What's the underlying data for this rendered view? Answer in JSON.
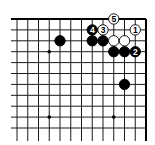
{
  "diagram": {
    "type": "go-board-fragment",
    "edges": [
      "top",
      "right"
    ],
    "grid": {
      "columns": 13,
      "rows": 11,
      "origin_x": 17,
      "origin_y": 19,
      "spacing_x": 10.75,
      "spacing_y": 10.9,
      "line_color": "#1a1a1a",
      "edge_color": "#000000"
    },
    "star_points": [
      {
        "col": 3,
        "row": 3
      },
      {
        "col": 3,
        "row": 9
      },
      {
        "col": 9,
        "row": 9
      }
    ],
    "stones": [
      {
        "col": 4,
        "row": 2,
        "color": "black",
        "label": ""
      },
      {
        "col": 7,
        "row": 1,
        "color": "black",
        "label": "4"
      },
      {
        "col": 8,
        "row": 1,
        "color": "white",
        "label": "3"
      },
      {
        "col": 9,
        "row": 0,
        "color": "white",
        "label": "5"
      },
      {
        "col": 11,
        "row": 1,
        "color": "white",
        "label": "1"
      },
      {
        "col": 7,
        "row": 2,
        "color": "black",
        "label": ""
      },
      {
        "col": 8,
        "row": 2,
        "color": "black",
        "label": ""
      },
      {
        "col": 9,
        "row": 2,
        "color": "white",
        "label": ""
      },
      {
        "col": 10,
        "row": 2,
        "color": "white",
        "label": ""
      },
      {
        "col": 9,
        "row": 3,
        "color": "black",
        "label": ""
      },
      {
        "col": 10,
        "row": 3,
        "color": "black",
        "label": ""
      },
      {
        "col": 11,
        "row": 3,
        "color": "black",
        "label": "2"
      },
      {
        "col": 10,
        "row": 6,
        "color": "black",
        "label": ""
      }
    ],
    "colors": {
      "black_stone": "#000000",
      "white_stone": "#ffffff",
      "stone_outline": "#000000",
      "black_label": "#ffffff",
      "white_label": "#000000"
    }
  }
}
